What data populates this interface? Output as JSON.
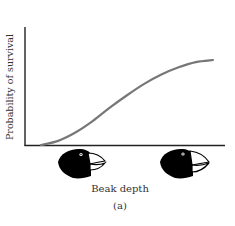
{
  "chart_data": {
    "type": "line",
    "title": "",
    "xlabel": "Beak depth",
    "ylabel": "Probability of survival",
    "caption": "(a)",
    "x_tick_icons": [
      "small-beak-finch-head",
      "large-beak-finch-head"
    ],
    "series": [
      {
        "name": "survival",
        "shape": "sigmoid",
        "x": [
          0,
          0.1,
          0.2,
          0.3,
          0.4,
          0.5,
          0.6,
          0.7,
          0.8,
          0.9,
          1.0
        ],
        "values": [
          0.0,
          0.04,
          0.12,
          0.23,
          0.36,
          0.48,
          0.59,
          0.68,
          0.75,
          0.8,
          0.82
        ]
      }
    ],
    "grid": false,
    "legend": null,
    "colors": {
      "curve": "#777777",
      "axes": "#222222"
    }
  },
  "labels": {
    "x_axis": "Beak depth",
    "y_axis": "Probability of survival",
    "caption": "(a)"
  }
}
